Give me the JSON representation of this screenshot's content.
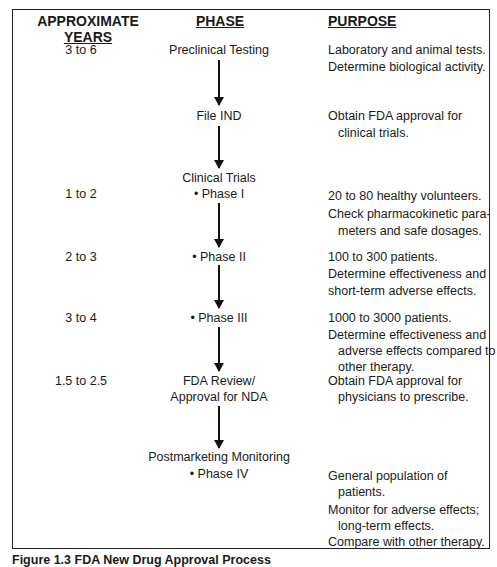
{
  "headers": {
    "years_line1": "APPROXIMATE",
    "years_line2": "YEARS",
    "phase": "PHASE",
    "purpose": "PURPOSE"
  },
  "rows": [
    {
      "years": "3 to 6",
      "phase": "Preclinical Testing",
      "purpose": [
        "Laboratory and animal tests.",
        "Determine biological activity."
      ]
    },
    {
      "years": "",
      "phase": "File IND",
      "purpose": [
        "Obtain FDA approval for",
        "clinical trials."
      ]
    },
    {
      "years": "",
      "phase": "Clinical Trials",
      "purpose": []
    },
    {
      "years": "1 to 2",
      "phase": "• Phase I",
      "purpose": [
        "20 to 80 healthy volunteers.",
        "Check pharmacokinetic para-",
        "meters and safe dosages."
      ]
    },
    {
      "years": "2 to 3",
      "phase": "• Phase II",
      "purpose": [
        "100 to 300 patients.",
        "Determine effectiveness and",
        "short-term adverse effects."
      ]
    },
    {
      "years": "3 to 4",
      "phase": "• Phase III",
      "purpose": [
        "1000 to 3000 patients.",
        "Determine effectiveness and",
        "adverse effects compared to",
        "other therapy."
      ]
    },
    {
      "years": "1.5 to 2.5",
      "phase_line1": "FDA Review/",
      "phase_line2": "Approval for NDA",
      "purpose": [
        "Obtain FDA approval for",
        "physicians to prescribe."
      ]
    },
    {
      "years": "",
      "phase": "Postmarketing Monitoring",
      "purpose": []
    },
    {
      "years": "",
      "phase": "• Phase IV",
      "purpose": [
        "General population of",
        "patients.",
        "Monitor for adverse effects;",
        "long-term effects.",
        "Compare with other therapy."
      ]
    }
  ],
  "caption": "Figure 1.3 FDA New Drug Approval Process"
}
